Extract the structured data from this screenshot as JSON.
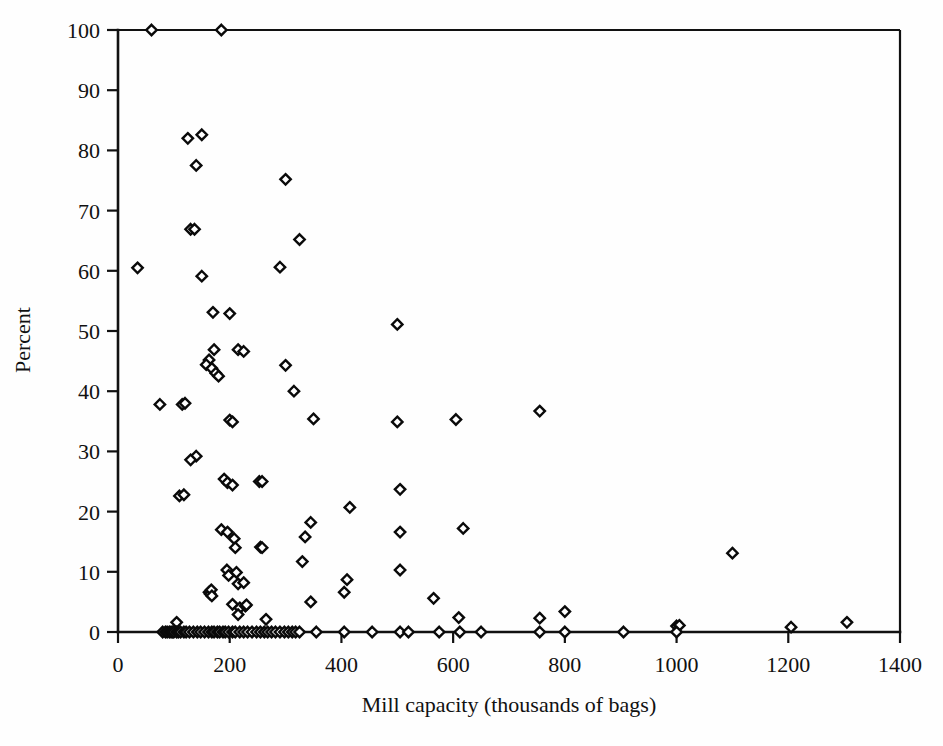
{
  "chart_data": {
    "type": "scatter",
    "title": "",
    "xlabel": "Mill capacity (thousands of bags)",
    "ylabel": "Percent",
    "xlim": [
      0,
      1400
    ],
    "ylim": [
      0,
      100
    ],
    "xticks": [
      0,
      200,
      400,
      600,
      800,
      1000,
      1200,
      1400
    ],
    "yticks": [
      0,
      10,
      20,
      30,
      40,
      50,
      60,
      70,
      80,
      90,
      100
    ],
    "xtick_labels": [
      "0",
      "200",
      "400",
      "600",
      "800",
      "1000",
      "1200",
      "1400"
    ],
    "ytick_labels": [
      "0",
      "10",
      "20",
      "30",
      "40",
      "50",
      "60",
      "70",
      "80",
      "90",
      "100"
    ],
    "grid": false,
    "legend": false,
    "marker": "open-diamond",
    "marker_edge_color": "#0a0a0a",
    "marker_face_color": "#ffffff",
    "axis_color": "#111111",
    "background_color": "#ffffff",
    "series": [
      {
        "name": "Mills",
        "points": [
          [
            60,
            100
          ],
          [
            185,
            100
          ],
          [
            35,
            60.5
          ],
          [
            125,
            82
          ],
          [
            150,
            82.6
          ],
          [
            140,
            77.5
          ],
          [
            300,
            75.2
          ],
          [
            130,
            66.9
          ],
          [
            137,
            66.9
          ],
          [
            325,
            65.2
          ],
          [
            150,
            59.1
          ],
          [
            290,
            60.6
          ],
          [
            200,
            52.9
          ],
          [
            170,
            53.1
          ],
          [
            500,
            51.1
          ],
          [
            172,
            46.9
          ],
          [
            215,
            46.9
          ],
          [
            225,
            46.6
          ],
          [
            163,
            45.2
          ],
          [
            158,
            44.4
          ],
          [
            168,
            43.8
          ],
          [
            175,
            43.0
          ],
          [
            180,
            42.5
          ],
          [
            300,
            44.3
          ],
          [
            315,
            40.0
          ],
          [
            75,
            37.8
          ],
          [
            115,
            37.8
          ],
          [
            120,
            38.0
          ],
          [
            200,
            35.2
          ],
          [
            205,
            34.9
          ],
          [
            350,
            35.4
          ],
          [
            500,
            34.9
          ],
          [
            605,
            35.3
          ],
          [
            755,
            36.7
          ],
          [
            140,
            29.2
          ],
          [
            130,
            28.6
          ],
          [
            110,
            22.6
          ],
          [
            118,
            22.8
          ],
          [
            190,
            25.4
          ],
          [
            196,
            24.8
          ],
          [
            205,
            24.4
          ],
          [
            253,
            25.0
          ],
          [
            258,
            25.0
          ],
          [
            505,
            23.7
          ],
          [
            415,
            20.7
          ],
          [
            345,
            18.2
          ],
          [
            618,
            17.2
          ],
          [
            185,
            17.0
          ],
          [
            196,
            16.6
          ],
          [
            505,
            16.6
          ],
          [
            335,
            15.8
          ],
          [
            208,
            15.5
          ],
          [
            210,
            14.0
          ],
          [
            255,
            14.1
          ],
          [
            258,
            14.0
          ],
          [
            1100,
            13.1
          ],
          [
            330,
            11.7
          ],
          [
            195,
            10.3
          ],
          [
            198,
            9.4
          ],
          [
            212,
            9.9
          ],
          [
            505,
            10.3
          ],
          [
            215,
            8.0
          ],
          [
            225,
            8.2
          ],
          [
            410,
            8.7
          ],
          [
            163,
            6.6
          ],
          [
            165,
            6.3
          ],
          [
            167,
            7.0
          ],
          [
            168,
            6.0
          ],
          [
            405,
            6.6
          ],
          [
            345,
            5.0
          ],
          [
            565,
            5.6
          ],
          [
            205,
            4.6
          ],
          [
            218,
            4.0
          ],
          [
            228,
            4.3
          ],
          [
            230,
            4.5
          ],
          [
            215,
            2.9
          ],
          [
            265,
            2.1
          ],
          [
            610,
            2.4
          ],
          [
            800,
            3.4
          ],
          [
            755,
            2.3
          ],
          [
            105,
            1.6
          ],
          [
            1000,
            1.0
          ],
          [
            1005,
            1.1
          ],
          [
            1205,
            0.8
          ],
          [
            1305,
            1.6
          ],
          [
            80,
            0
          ],
          [
            85,
            0
          ],
          [
            88,
            0
          ],
          [
            92,
            0
          ],
          [
            95,
            0
          ],
          [
            98,
            0
          ],
          [
            100,
            0
          ],
          [
            105,
            0
          ],
          [
            108,
            0
          ],
          [
            112,
            0
          ],
          [
            118,
            0
          ],
          [
            122,
            0
          ],
          [
            128,
            0
          ],
          [
            135,
            0
          ],
          [
            142,
            0
          ],
          [
            148,
            0
          ],
          [
            155,
            0
          ],
          [
            162,
            0
          ],
          [
            168,
            0
          ],
          [
            172,
            0
          ],
          [
            178,
            0
          ],
          [
            182,
            0
          ],
          [
            188,
            0
          ],
          [
            192,
            0
          ],
          [
            198,
            0
          ],
          [
            205,
            0
          ],
          [
            210,
            0
          ],
          [
            218,
            0
          ],
          [
            225,
            0
          ],
          [
            232,
            0
          ],
          [
            240,
            0
          ],
          [
            248,
            0
          ],
          [
            255,
            0
          ],
          [
            262,
            0
          ],
          [
            268,
            0
          ],
          [
            275,
            0
          ],
          [
            282,
            0
          ],
          [
            290,
            0
          ],
          [
            298,
            0
          ],
          [
            305,
            0
          ],
          [
            312,
            0
          ],
          [
            318,
            0
          ],
          [
            325,
            0
          ],
          [
            355,
            0
          ],
          [
            405,
            0
          ],
          [
            455,
            0
          ],
          [
            505,
            0
          ],
          [
            520,
            0
          ],
          [
            575,
            0
          ],
          [
            612,
            0
          ],
          [
            650,
            0
          ],
          [
            755,
            0
          ],
          [
            800,
            0
          ],
          [
            905,
            0
          ],
          [
            1000,
            0
          ]
        ]
      }
    ]
  },
  "axes": {
    "y_axis_title": "Percent",
    "x_axis_title": "Mill capacity (thousands of bags)"
  }
}
